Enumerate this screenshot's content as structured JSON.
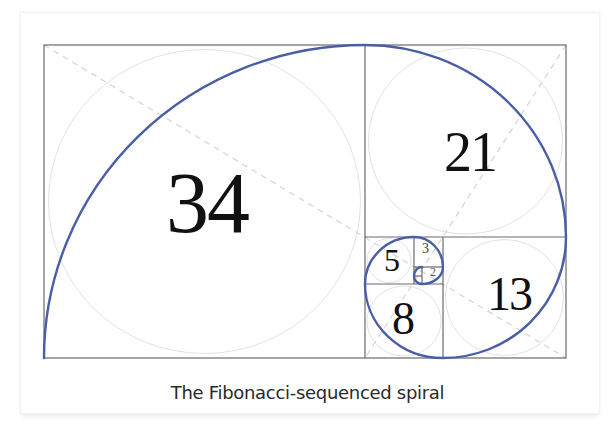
{
  "figure": {
    "caption": "The Fibonacci-sequenced spiral",
    "squares": [
      {
        "label": "34",
        "value": 34
      },
      {
        "label": "21",
        "value": 21
      },
      {
        "label": "13",
        "value": 13
      },
      {
        "label": "8",
        "value": 8
      },
      {
        "label": "5",
        "value": 5
      },
      {
        "label": "3",
        "value": 3
      },
      {
        "label": "2",
        "value": 2
      },
      {
        "label": "1",
        "value": 1
      },
      {
        "label": "1",
        "value": 1
      }
    ],
    "colors": {
      "spiral": "#4a5ea8",
      "grid_lines": "#555555",
      "guide_circles": "#dcdcdc",
      "guide_diagonals": "#cfcfcf",
      "numbers": "#111111",
      "caption": "#2a2a2a"
    }
  }
}
